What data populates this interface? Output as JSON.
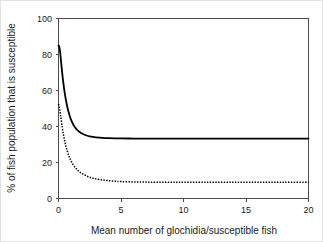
{
  "chart_data": {
    "type": "line",
    "title": "",
    "xlabel": "Mean number of glochidia/susceptible fish",
    "ylabel": "% of fish population that is susceptible",
    "xlim": [
      0,
      20
    ],
    "ylim": [
      0,
      100
    ],
    "xticks": [
      0,
      5,
      10,
      15,
      20
    ],
    "yticks": [
      0,
      20,
      40,
      60,
      80,
      100
    ],
    "xtick_labels": [
      "0",
      "5",
      "10",
      "15",
      "20"
    ],
    "ytick_labels": [
      "0",
      "20",
      "40",
      "60",
      "80",
      "100"
    ],
    "grid": false,
    "legend": "none",
    "series": [
      {
        "name": "upper-curve",
        "style": "solid",
        "x": [
          0.0,
          0.05,
          0.1,
          0.15,
          0.2,
          0.3,
          0.4,
          0.5,
          0.6,
          0.7,
          0.8,
          0.9,
          1.0,
          1.2,
          1.4,
          1.6,
          1.8,
          2.0,
          2.25,
          2.5,
          2.75,
          3.0,
          3.5,
          4.0,
          4.5,
          5.0,
          6.0,
          7.0,
          8.0,
          9.0,
          10.0,
          12.0,
          14.0,
          16.0,
          18.0,
          20.0
        ],
        "values": [
          85.0,
          84.5,
          83.0,
          80.0,
          76.5,
          69.5,
          63.5,
          58.5,
          54.5,
          51.0,
          48.2,
          45.8,
          43.8,
          40.8,
          38.8,
          37.4,
          36.4,
          35.7,
          35.0,
          34.5,
          34.2,
          34.0,
          33.7,
          33.5,
          33.4,
          33.4,
          33.3,
          33.3,
          33.3,
          33.3,
          33.3,
          33.3,
          33.3,
          33.3,
          33.3,
          33.3
        ]
      },
      {
        "name": "lower-curve",
        "style": "dotted",
        "x": [
          0.0,
          0.05,
          0.1,
          0.15,
          0.2,
          0.3,
          0.4,
          0.5,
          0.6,
          0.7,
          0.8,
          0.9,
          1.0,
          1.2,
          1.4,
          1.6,
          1.8,
          2.0,
          2.25,
          2.5,
          2.75,
          3.0,
          3.5,
          4.0,
          4.5,
          5.0,
          6.0,
          7.0,
          8.0,
          9.0,
          10.0,
          12.0,
          14.0,
          16.0,
          18.0,
          20.0
        ],
        "values": [
          52.5,
          51.5,
          49.5,
          47.0,
          44.5,
          39.5,
          35.3,
          31.8,
          28.9,
          26.4,
          24.3,
          22.5,
          21.0,
          18.5,
          16.7,
          15.3,
          14.2,
          13.4,
          12.5,
          11.8,
          11.3,
          10.9,
          10.3,
          9.9,
          9.6,
          9.4,
          9.2,
          9.1,
          9.0,
          9.0,
          9.0,
          9.0,
          9.0,
          9.0,
          9.0,
          9.0
        ]
      }
    ]
  },
  "axes": {
    "y_axis_title": "% of fish population that is susceptible",
    "x_axis_title": "Mean number of glochidia/susceptible fish"
  }
}
